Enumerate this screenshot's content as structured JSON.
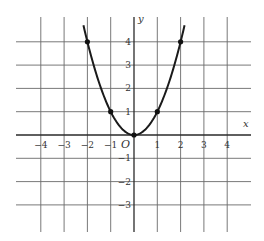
{
  "chart_data": {
    "type": "line",
    "title": "",
    "function": "y = x^2",
    "xlabel": "x",
    "ylabel": "y",
    "origin_label": "O",
    "xlim": [
      -4.8,
      4.8
    ],
    "ylim": [
      -4,
      5.2
    ],
    "grid": true,
    "x_ticks": [
      -4,
      -3,
      -2,
      -1,
      1,
      2,
      3,
      4
    ],
    "y_ticks": [
      4,
      3,
      2,
      1,
      -1,
      -2,
      -3
    ],
    "x_tick_labels": [
      "−4",
      "−3",
      "−2",
      "−1",
      "1",
      "2",
      "3",
      "4"
    ],
    "y_tick_labels": [
      "4",
      "3",
      "2",
      "1",
      "−1",
      "−2",
      "−3"
    ],
    "points": [
      {
        "x": -2,
        "y": 4
      },
      {
        "x": -1,
        "y": 1
      },
      {
        "x": 0,
        "y": 0
      },
      {
        "x": 1,
        "y": 1
      },
      {
        "x": 2,
        "y": 4
      }
    ],
    "curve_x_range": [
      -2.17,
      2.17
    ]
  }
}
